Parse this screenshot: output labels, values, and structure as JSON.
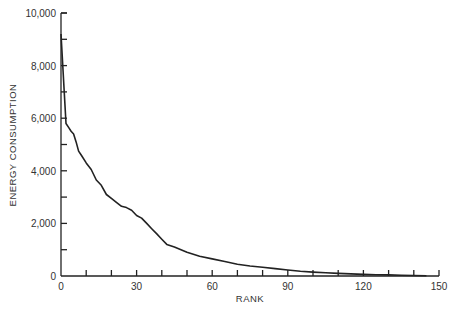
{
  "chart_data": {
    "type": "line",
    "title": "",
    "xlabel": "RANK",
    "ylabel": "ENERGY CONSUMPTION",
    "xlim": [
      0,
      150
    ],
    "ylim": [
      0,
      10000
    ],
    "x_ticks": [
      0,
      30,
      60,
      90,
      120,
      150
    ],
    "x_tick_labels": [
      "0",
      "30",
      "60",
      "90",
      "120",
      "150"
    ],
    "x_minor_ticks": [
      10,
      20,
      40,
      50,
      70,
      80,
      100,
      110,
      130,
      140
    ],
    "y_ticks": [
      0,
      2000,
      4000,
      6000,
      8000,
      10000
    ],
    "y_tick_labels": [
      "0",
      "2,000",
      "4,000",
      "6,000",
      "8,000",
      "10,000"
    ],
    "y_minor_ticks": [
      1000,
      3000,
      5000,
      7000,
      9000
    ],
    "grid": false,
    "legend": null,
    "series": [
      {
        "name": "Energy consumption by rank",
        "x": [
          0,
          1,
          2,
          3,
          4,
          5,
          6,
          7,
          8,
          10,
          12,
          14,
          16,
          18,
          20,
          22,
          24,
          26,
          28,
          30,
          32,
          34,
          36,
          38,
          40,
          42,
          45,
          50,
          55,
          60,
          65,
          70,
          75,
          80,
          85,
          90,
          95,
          100,
          105,
          110,
          115,
          120,
          125,
          130,
          135,
          140,
          145
        ],
        "values": [
          9200,
          7500,
          5800,
          5650,
          5500,
          5400,
          5100,
          4750,
          4600,
          4300,
          4050,
          3650,
          3450,
          3100,
          2950,
          2800,
          2650,
          2600,
          2500,
          2300,
          2200,
          2000,
          1800,
          1600,
          1400,
          1200,
          1100,
          900,
          750,
          650,
          550,
          450,
          380,
          330,
          280,
          230,
          180,
          150,
          120,
          100,
          80,
          60,
          50,
          40,
          30,
          20,
          10
        ]
      }
    ]
  }
}
